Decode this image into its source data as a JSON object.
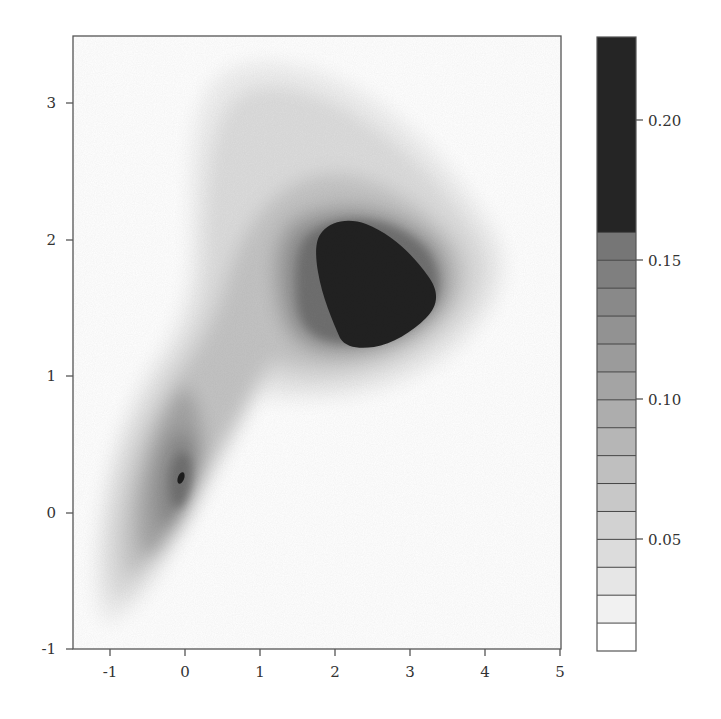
{
  "chart_data": {
    "type": "contour",
    "title": "",
    "xlabel": "",
    "ylabel": "",
    "xlim": [
      -1.5,
      5
    ],
    "ylim": [
      -1,
      3.5
    ],
    "x_ticks": [
      "-1",
      "0",
      "1",
      "2",
      "3",
      "4",
      "5"
    ],
    "x_tick_values": [
      -1,
      0,
      1,
      2,
      3,
      4,
      5
    ],
    "y_ticks": [
      "-1",
      "0",
      "1",
      "2",
      "3"
    ],
    "y_tick_values": [
      -1,
      0,
      1,
      2,
      3
    ],
    "grid": false,
    "colormap": "grayscale (white = low, black = high)",
    "modes": [
      {
        "name": "upper mode",
        "center": [
          2.5,
          1.7
        ],
        "peak_level": ">0.16",
        "region_above_0.16": {
          "x": [
            1.8,
            3.4
          ],
          "y": [
            1.2,
            2.1
          ]
        }
      },
      {
        "name": "lower mode",
        "center": [
          -0.05,
          0.25
        ],
        "peak_level": "~0.16"
      }
    ],
    "outer_extent": {
      "x": [
        -1.1,
        4.4
      ],
      "y": [
        -0.75,
        3.3
      ]
    },
    "colorbar": {
      "levels": [
        0.01,
        0.02,
        0.03,
        0.04,
        0.05,
        0.06,
        0.07,
        0.08,
        0.09,
        0.1,
        0.11,
        0.12,
        0.13,
        0.14,
        0.15,
        0.16,
        0.23
      ],
      "tick_labels": [
        "0.05",
        "0.10",
        "0.15",
        "0.20"
      ],
      "tick_values": [
        0.05,
        0.1,
        0.15,
        0.2
      ],
      "range": [
        0.01,
        0.23
      ],
      "band_colors": [
        "#ffffff",
        "#f1f1f1",
        "#e6e6e6",
        "#dcdcdc",
        "#d2d2d2",
        "#c8c8c8",
        "#bfbfbf",
        "#b6b6b6",
        "#adadad",
        "#a4a4a4",
        "#9b9b9b",
        "#929292",
        "#898989",
        "#7f7f7f",
        "#767676",
        "#252525"
      ]
    }
  }
}
